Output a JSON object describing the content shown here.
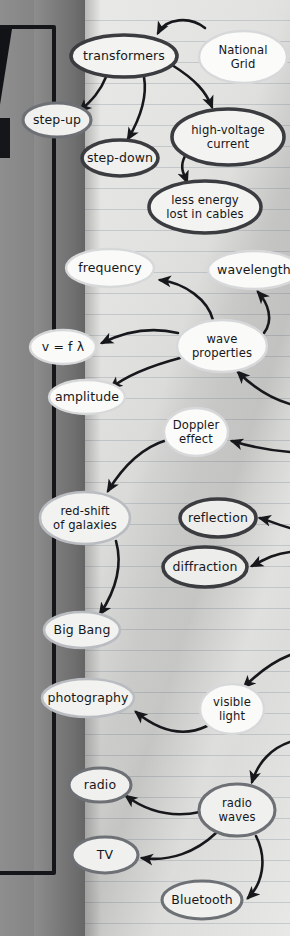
{
  "document": {
    "type": "hand-drawn mind map on lined notebook paper",
    "subject": "Physics — waves and the National Grid"
  },
  "nodes": [
    {
      "id": "transformers",
      "label": "transformers",
      "lines": [
        "transformers"
      ],
      "cx": 124,
      "cy": 56,
      "rx": 53,
      "ry": 21,
      "weight": "heavy",
      "fill": "#f3f3f1"
    },
    {
      "id": "national-grid",
      "label": "National Grid",
      "lines": [
        "National",
        "Grid"
      ],
      "cx": 243,
      "cy": 57,
      "rx": 44,
      "ry": 26,
      "weight": "xlight",
      "fill": "#fbfbf9"
    },
    {
      "id": "step-up",
      "label": "step-up",
      "lines": [
        "step-up"
      ],
      "cx": 57,
      "cy": 120,
      "rx": 34,
      "ry": 17,
      "weight": "mid",
      "fill": "#f0f0ee"
    },
    {
      "id": "step-down",
      "label": "step-down",
      "lines": [
        "step-down"
      ],
      "cx": 120,
      "cy": 158,
      "rx": 38,
      "ry": 18,
      "weight": "heavy",
      "fill": "#f0f0ee"
    },
    {
      "id": "high-voltage",
      "label": "high-voltage current",
      "lines": [
        "high-voltage",
        "current"
      ],
      "cx": 228,
      "cy": 137,
      "rx": 56,
      "ry": 28,
      "weight": "heavy",
      "fill": "#f3f3f1"
    },
    {
      "id": "less-energy",
      "label": "less energy lost in cables",
      "lines": [
        "less energy",
        "lost in cables"
      ],
      "cx": 205,
      "cy": 207,
      "rx": 56,
      "ry": 26,
      "weight": "heavy",
      "fill": "#f3f3f1"
    },
    {
      "id": "frequency",
      "label": "frequency",
      "lines": [
        "frequency"
      ],
      "cx": 110,
      "cy": 268,
      "rx": 44,
      "ry": 19,
      "weight": "xlight",
      "fill": "#fafaf8"
    },
    {
      "id": "wavelength",
      "label": "wavelength",
      "lines": [
        "wavelength"
      ],
      "cx": 254,
      "cy": 270,
      "rx": 46,
      "ry": 19,
      "weight": "xlight",
      "fill": "#fafaf8"
    },
    {
      "id": "wave-properties",
      "label": "wave properties",
      "lines": [
        "wave",
        "properties"
      ],
      "cx": 222,
      "cy": 346,
      "rx": 45,
      "ry": 26,
      "weight": "xlight",
      "fill": "#fafaf8"
    },
    {
      "id": "v-f-lambda",
      "label": "v = f λ",
      "lines": [
        "v = f λ"
      ],
      "cx": 63,
      "cy": 347,
      "rx": 33,
      "ry": 17,
      "weight": "xlight",
      "fill": "#fafaf8"
    },
    {
      "id": "amplitude",
      "label": "amplitude",
      "lines": [
        "amplitude"
      ],
      "cx": 87,
      "cy": 397,
      "rx": 38,
      "ry": 17,
      "weight": "xlight",
      "fill": "#fafaf8"
    },
    {
      "id": "doppler-effect",
      "label": "Doppler effect",
      "lines": [
        "Doppler",
        "effect"
      ],
      "cx": 196,
      "cy": 432,
      "rx": 32,
      "ry": 24,
      "weight": "xlight",
      "fill": "#fbfbf9"
    },
    {
      "id": "red-shift",
      "label": "red-shift of galaxies",
      "lines": [
        "red-shift",
        "of galaxies"
      ],
      "cx": 85,
      "cy": 518,
      "rx": 45,
      "ry": 26,
      "weight": "light",
      "fill": "#f2f2f0"
    },
    {
      "id": "reflection",
      "label": "reflection",
      "lines": [
        "reflection"
      ],
      "cx": 218,
      "cy": 518,
      "rx": 38,
      "ry": 19,
      "weight": "heavy",
      "fill": "#ededeb"
    },
    {
      "id": "diffraction",
      "label": "diffraction",
      "lines": [
        "diffraction"
      ],
      "cx": 205,
      "cy": 567,
      "rx": 42,
      "ry": 20,
      "weight": "heavy",
      "fill": "#ededeb"
    },
    {
      "id": "big-bang",
      "label": "Big Bang",
      "lines": [
        "Big Bang"
      ],
      "cx": 82,
      "cy": 630,
      "rx": 38,
      "ry": 18,
      "weight": "light",
      "fill": "#f2f2f0"
    },
    {
      "id": "photography",
      "label": "photography",
      "lines": [
        "photography"
      ],
      "cx": 88,
      "cy": 698,
      "rx": 46,
      "ry": 19,
      "weight": "light",
      "fill": "#f2f2f0"
    },
    {
      "id": "visible-light",
      "label": "visible light",
      "lines": [
        "visible",
        "light"
      ],
      "cx": 232,
      "cy": 709,
      "rx": 32,
      "ry": 25,
      "weight": "xlight",
      "fill": "#fafaf8"
    },
    {
      "id": "radio",
      "label": "radio",
      "lines": [
        "radio"
      ],
      "cx": 100,
      "cy": 785,
      "rx": 31,
      "ry": 17,
      "weight": "mid",
      "fill": "#f0f0ee"
    },
    {
      "id": "radio-waves",
      "label": "radio waves",
      "lines": [
        "radio",
        "waves"
      ],
      "cx": 237,
      "cy": 810,
      "rx": 38,
      "ry": 26,
      "weight": "mid",
      "fill": "#f0f0ee"
    },
    {
      "id": "tv",
      "label": "TV",
      "lines": [
        "TV"
      ],
      "cx": 105,
      "cy": 855,
      "rx": 33,
      "ry": 18,
      "weight": "mid",
      "fill": "#f0f0ee"
    },
    {
      "id": "bluetooth",
      "label": "Bluetooth",
      "lines": [
        "Bluetooth"
      ],
      "cx": 202,
      "cy": 900,
      "rx": 40,
      "ry": 19,
      "weight": "mid",
      "fill": "#f0f0ee"
    }
  ],
  "edges": [
    {
      "id": "nationalgrid-to-transformers",
      "from": "national-grid",
      "to": "transformers",
      "d": "M 205 28 C 190 16 166 18 158 33"
    },
    {
      "id": "transformers-to-stepup",
      "from": "transformers",
      "to": "step-up",
      "d": "M 106 77 C 100 92 92 100 80 111"
    },
    {
      "id": "transformers-to-stepdown",
      "from": "transformers",
      "to": "step-down",
      "d": "M 144 77 C 148 100 138 122 128 139"
    },
    {
      "id": "transformers-to-highvoltage",
      "from": "transformers",
      "to": "high-voltage",
      "d": "M 172 65 C 196 80 206 92 212 107"
    },
    {
      "id": "highvoltage-to-lessenergy",
      "from": "high-voltage",
      "to": "less-energy",
      "d": "M 185 156 C 179 168 184 174 187 182"
    },
    {
      "id": "waveprops-to-frequency",
      "from": "wave-properties",
      "to": "frequency",
      "d": "M 213 320 C 208 300 185 283 160 280"
    },
    {
      "id": "waveprops-to-wavelength",
      "from": "wave-properties",
      "to": "wavelength",
      "d": "M 264 333 C 274 320 268 303 258 292"
    },
    {
      "id": "waveprops-to-vflambda",
      "from": "wave-properties",
      "to": "v-f-lambda",
      "d": "M 178 333 C 148 326 122 333 102 343"
    },
    {
      "id": "waveprops-to-amplitude",
      "from": "wave-properties",
      "to": "amplitude",
      "d": "M 180 358 C 150 366 126 376 111 388"
    },
    {
      "id": "rightside-to-waveprops",
      "from": "off-right",
      "to": "wave-properties",
      "d": "M 290 404 C 268 398 252 386 238 372"
    },
    {
      "id": "rightside-to-doppler",
      "from": "off-right",
      "to": "doppler-effect",
      "d": "M 290 452 C 265 450 248 446 232 441"
    },
    {
      "id": "doppler-to-redshift",
      "from": "doppler-effect",
      "to": "red-shift",
      "d": "M 167 440 C 140 448 122 468 108 491"
    },
    {
      "id": "redshift-to-bigbang",
      "from": "red-shift",
      "to": "big-bang",
      "d": "M 116 541 C 124 570 112 596 100 614"
    },
    {
      "id": "rightside-to-reflection",
      "from": "off-right",
      "to": "reflection",
      "d": "M 290 528 C 275 524 268 520 260 518"
    },
    {
      "id": "rightside-to-diffraction",
      "from": "off-right",
      "to": "diffraction",
      "d": "M 290 552 C 272 554 262 561 252 566"
    },
    {
      "id": "visiblelight-to-photography",
      "from": "visible-light",
      "to": "photography",
      "d": "M 207 726 C 182 738 158 730 136 712"
    },
    {
      "id": "rightside-to-visiblelight",
      "from": "off-right",
      "to": "visible-light",
      "d": "M 290 655 C 272 662 258 673 244 687"
    },
    {
      "id": "rightside-to-radiowaves",
      "from": "off-right",
      "to": "radio-waves",
      "d": "M 290 742 C 272 748 258 762 252 782"
    },
    {
      "id": "radiowaves-to-radio",
      "from": "radio-waves",
      "to": "radio",
      "d": "M 200 812 C 172 818 148 812 126 796"
    },
    {
      "id": "radiowaves-to-tv",
      "from": "radio-waves",
      "to": "tv",
      "d": "M 216 833 C 196 852 170 862 142 858"
    },
    {
      "id": "radiowaves-to-bluetooth",
      "from": "radio-waves",
      "to": "bluetooth",
      "d": "M 256 836 C 268 860 262 884 248 898"
    }
  ],
  "frame": {
    "name": "notebook-cover-edge",
    "color": "#15161a"
  }
}
